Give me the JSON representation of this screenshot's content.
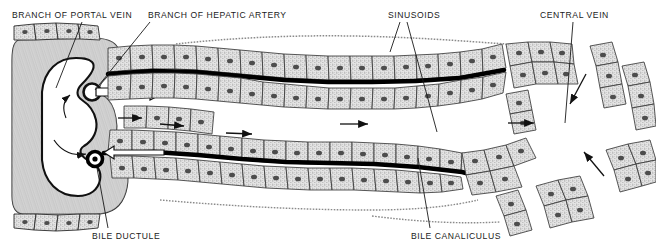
{
  "figure": {
    "width": 656,
    "height": 250,
    "background_color": "#ffffff",
    "ink_color": "#1a1a1a",
    "cell_fill_color": "#dedede",
    "nucleus_color": "#4a4a4a",
    "canaliculus_color": "#000000"
  },
  "labels": {
    "portal_vein": "BRANCH OF PORTAL VEIN",
    "hepatic_artery": "BRANCH OF HEPATIC ARTERY",
    "sinusoids": "SINUSOIDS",
    "central_vein": "CENTRAL VEIN",
    "bile_ductule": "BILE DUCTULE",
    "bile_canaliculus": "BILE CANALICULUS"
  },
  "leader_lines": [
    {
      "name": "portal-vein-leader",
      "x1": 82,
      "y1": 22,
      "x2": 56,
      "y2": 88
    },
    {
      "name": "hepatic-artery-leader",
      "x1": 150,
      "y1": 22,
      "x2": 95,
      "y2": 90
    },
    {
      "name": "sinusoids-leader-left",
      "x1": 400,
      "y1": 22,
      "x2": 390,
      "y2": 52
    },
    {
      "name": "sinusoids-leader-right",
      "x1": 407,
      "y1": 22,
      "x2": 437,
      "y2": 132
    },
    {
      "name": "central-vein-leader",
      "x1": 573,
      "y1": 22,
      "x2": 565,
      "y2": 123
    },
    {
      "name": "bile-ductule-leader",
      "x1": 108,
      "y1": 228,
      "x2": 97,
      "y2": 168
    },
    {
      "name": "bile-canaliculus-leader",
      "x1": 430,
      "y1": 228,
      "x2": 418,
      "y2": 158
    }
  ],
  "structures": {
    "portal_vein": {
      "name": "branch-of-portal-vein",
      "description": "large C-shaped vessel lumen with thick hatched wall at left edge",
      "lumen_fill": "#ffffff"
    },
    "hepatic_artery": {
      "name": "branch-of-hepatic-artery",
      "description": "small round arterial opening with outflow arrow into sinusoid",
      "center_x": 92,
      "center_y": 92,
      "radius": 8
    },
    "bile_ductule": {
      "name": "bile-ductule",
      "description": "small dark ring collecting bile from canaliculus",
      "center_x": 95,
      "center_y": 159,
      "radius": 7
    },
    "central_vein": {
      "name": "central-vein",
      "description": "open space at right surrounded by radiating hepatocyte cords",
      "center_x": 576,
      "center_y": 140
    }
  },
  "flow_arrows": [
    {
      "name": "blood-flow-arrow-1",
      "direction": "right"
    },
    {
      "name": "blood-flow-arrow-2",
      "direction": "right"
    },
    {
      "name": "blood-flow-arrow-3",
      "direction": "right"
    },
    {
      "name": "blood-flow-arrow-4",
      "direction": "right"
    },
    {
      "name": "bile-flow-arrow",
      "direction": "left"
    },
    {
      "name": "central-vein-arrow-upper",
      "direction": "down-left"
    },
    {
      "name": "central-vein-arrow-lower",
      "direction": "up-left"
    },
    {
      "name": "central-vein-arrow-mid",
      "direction": "right"
    }
  ]
}
